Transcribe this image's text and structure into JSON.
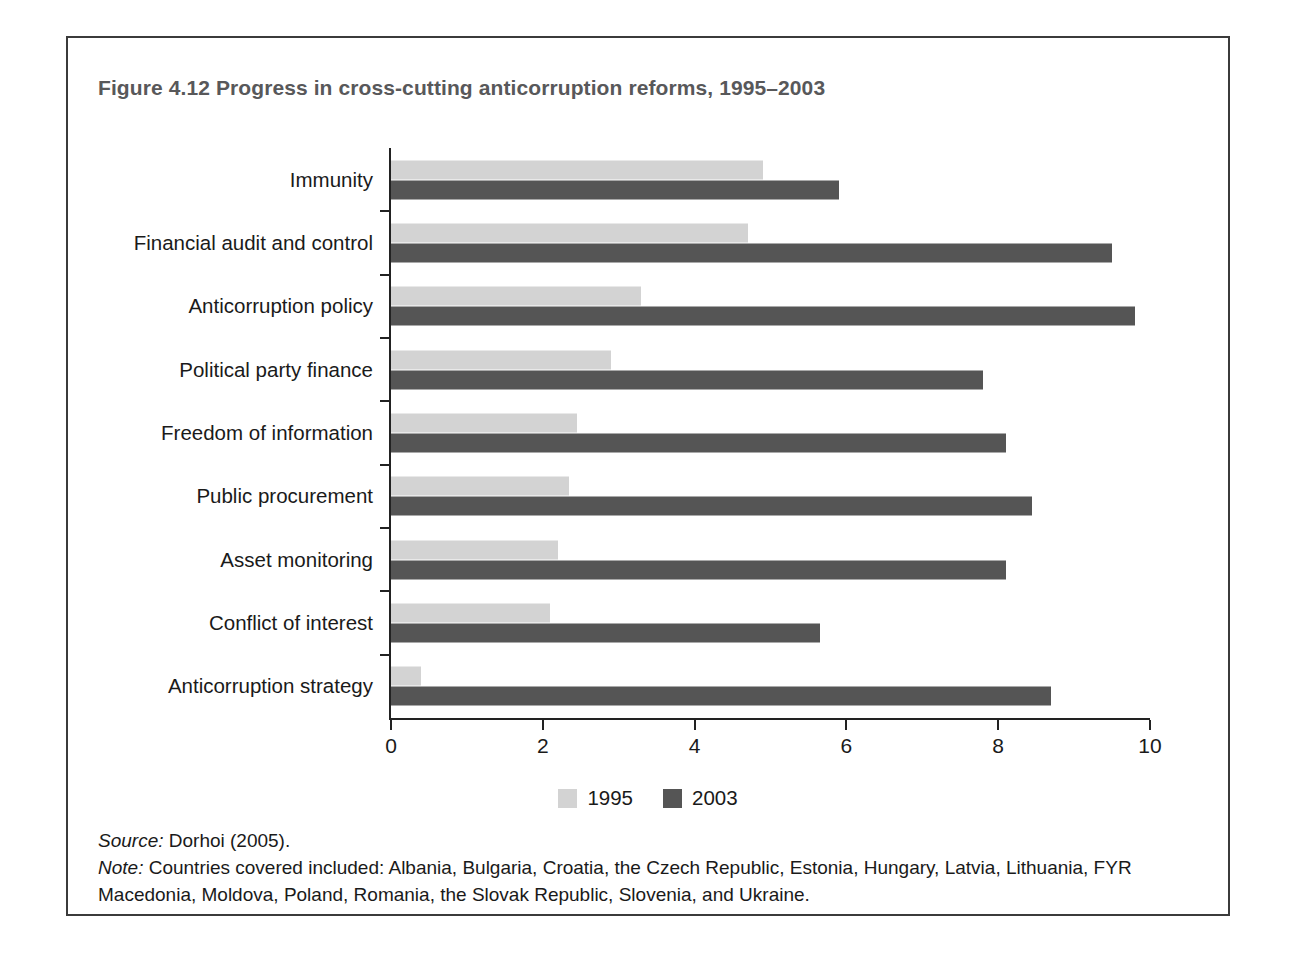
{
  "figure": {
    "title": "Figure 4.12  Progress in cross-cutting anticorruption reforms, 1995–2003",
    "source_tag": "Source:",
    "source_text": " Dorhoi (2005).",
    "note_tag": "Note:",
    "note_text": " Countries covered included: Albania, Bulgaria, Croatia, the Czech Republic, Estonia, Hungary, Latvia, Lithuania, FYR Macedonia, Moldova, Poland, Romania, the Slovak Republic, Slovenia, and Ukraine."
  },
  "colors": {
    "series_1995": "#d3d3d3",
    "series_2003": "#555555",
    "axis": "#222222",
    "title": "#58585a",
    "frame": "#3b3b3b"
  },
  "chart_data": {
    "type": "bar",
    "orientation": "horizontal",
    "title": "Figure 4.12  Progress in cross-cutting anticorruption reforms, 1995–2003",
    "xlabel": "",
    "ylabel": "",
    "xlim": [
      0,
      10
    ],
    "xticks": [
      "0",
      "2",
      "4",
      "6",
      "8",
      "10"
    ],
    "xtick_values": [
      0,
      2,
      4,
      6,
      8,
      10
    ],
    "grid": false,
    "legend_position": "bottom-center",
    "categories": [
      "Immunity",
      "Financial audit and control",
      "Anticorruption policy",
      "Political party finance",
      "Freedom of information",
      "Public procurement",
      "Asset monitoring",
      "Conflict of interest",
      "Anticorruption strategy"
    ],
    "series": [
      {
        "name": "1995",
        "color": "#d3d3d3",
        "values": [
          4.9,
          4.7,
          3.3,
          2.9,
          2.45,
          2.35,
          2.2,
          2.1,
          0.4
        ]
      },
      {
        "name": "2003",
        "color": "#555555",
        "values": [
          5.9,
          9.5,
          9.8,
          7.8,
          8.1,
          8.45,
          8.1,
          5.65,
          8.7
        ]
      }
    ]
  }
}
